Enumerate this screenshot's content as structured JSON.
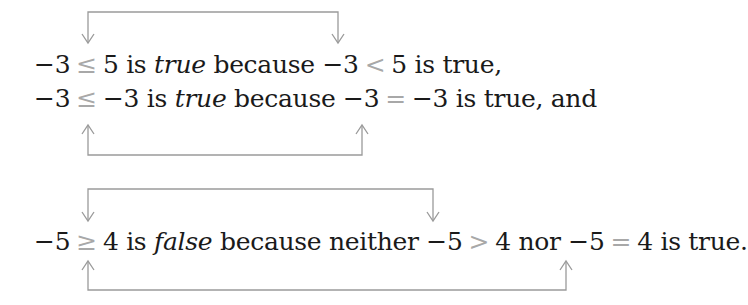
{
  "colors": {
    "text": "#1a1a1a",
    "relation_symbol": "#a8a8a8",
    "bracket_line": "#9a9a9a",
    "background": "#ffffff"
  },
  "lines": [
    {
      "lhs": "−3",
      "rel": "≤",
      "rhs": "5 is",
      "verdict": "true",
      "because": "because −3",
      "rel2": "<",
      "tail": "5 is true,"
    },
    {
      "lhs": "−3",
      "rel": "≤",
      "rhs": "−3 is",
      "verdict": "true",
      "because": "because −3",
      "rel2": "=",
      "tail": "−3 is true, and"
    },
    {
      "lhs": "−5",
      "rel": "≥",
      "rhs": "4 is",
      "verdict": "false",
      "because": "because neither −5",
      "rel2": ">",
      "mid": "4 nor −5",
      "rel3": "=",
      "tail": "4 is true."
    }
  ],
  "brackets": [
    {
      "name": "bracket-le-to-lt",
      "direction": "top",
      "from": "≤",
      "to": "<"
    },
    {
      "name": "bracket-le-to-eq",
      "direction": "bottom",
      "from": "≤",
      "to": "="
    },
    {
      "name": "bracket-ge-to-gt",
      "direction": "top",
      "from": "≥",
      "to": ">"
    },
    {
      "name": "bracket-ge-to-eq",
      "direction": "bottom",
      "from": "≥",
      "to": "="
    }
  ]
}
